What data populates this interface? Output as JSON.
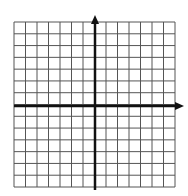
{
  "diagram": {
    "type": "coordinate-grid",
    "grid": {
      "left": 14,
      "top": 22,
      "right": 175,
      "bottom": 187,
      "columns": 14,
      "rows": 14,
      "line_color": "#555555"
    },
    "axes": {
      "x_axis_y": 106,
      "y_axis_x": 95,
      "x_arrow_tip": 184,
      "y_arrow_tip": 15,
      "color": "#111111"
    }
  }
}
